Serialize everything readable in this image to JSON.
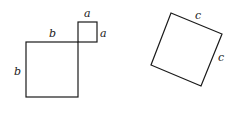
{
  "diagram": {
    "left_figure": {
      "big_square": {
        "side_label": "b",
        "top_label": "b",
        "left_label": "b"
      },
      "small_square": {
        "top_label": "a",
        "right_label": "a"
      }
    },
    "right_figure": {
      "tilted_square": {
        "top_label": "c",
        "right_label": "c"
      }
    },
    "colors": {
      "stroke": "#1a1a1a",
      "background": "#ffffff"
    }
  }
}
